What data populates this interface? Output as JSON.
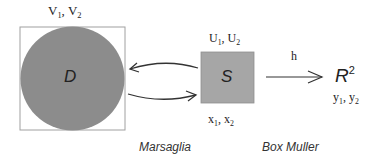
{
  "diagram": {
    "disk": {
      "label": "D",
      "var_label_1": "V",
      "var_sub_1": "1",
      "var_sep": ", ",
      "var_label_2": "V",
      "var_sub_2": "2"
    },
    "square": {
      "label": "S",
      "top_1": "U",
      "top_sub_1": "1",
      "top_sep": ", ",
      "top_2": "U",
      "top_sub_2": "2",
      "bottom_1": "x",
      "bottom_sub_1": "1",
      "bottom_sep": ", ",
      "bottom_2": "x",
      "bottom_sub_2": "2"
    },
    "plane": {
      "label": "R",
      "sup": "2",
      "var_1": "y",
      "var_sub_1": "1",
      "var_sep": ", ",
      "var_2": "y",
      "var_sub_2": "2"
    },
    "map_label": "h",
    "captions": {
      "left": "Marsaglia",
      "right": "Box Muller"
    },
    "colors": {
      "fill": "#8c8c8c",
      "square_fill": "#a6a6a6",
      "outline": "#9a9a9a",
      "arrow": "#333333"
    }
  }
}
